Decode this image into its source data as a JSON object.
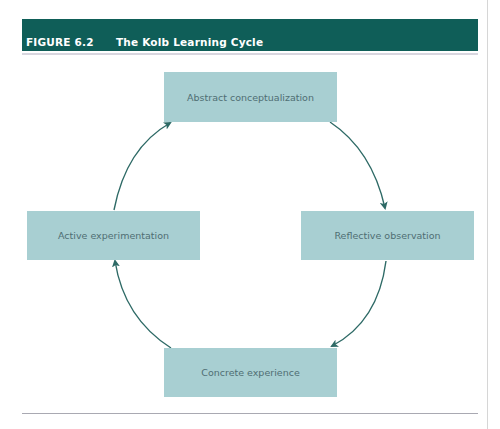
{
  "figure": {
    "label": "FIGURE 6.2",
    "title": "The Kolb Learning Cycle"
  },
  "colors": {
    "header_bg": "#0f5e58",
    "box_fill": "#a8cfd2",
    "arrow": "#2e6a66",
    "box_text": "#4f6e72"
  },
  "cycle": {
    "nodes": [
      {
        "id": "abstract",
        "label": "Abstract conceptualization",
        "position": "top"
      },
      {
        "id": "reflective",
        "label": "Reflective observation",
        "position": "right"
      },
      {
        "id": "concrete",
        "label": "Concrete experience",
        "position": "bottom"
      },
      {
        "id": "active",
        "label": "Active experimentation",
        "position": "left"
      }
    ],
    "edges": [
      {
        "from": "abstract",
        "to": "reflective"
      },
      {
        "from": "reflective",
        "to": "concrete"
      },
      {
        "from": "concrete",
        "to": "active"
      },
      {
        "from": "active",
        "to": "abstract"
      }
    ]
  }
}
